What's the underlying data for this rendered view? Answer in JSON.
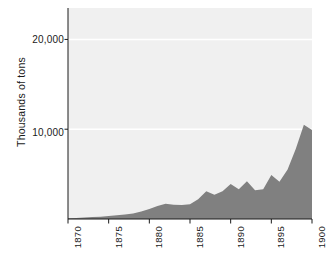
{
  "chart_data": {
    "type": "area",
    "title": "",
    "subtitle": "",
    "xlabel": "",
    "ylabel": "Thousands of tons",
    "xlim": [
      1870,
      1900
    ],
    "ylim": [
      0,
      23500
    ],
    "grid": true,
    "grid_color": "#ffffff",
    "legend": null,
    "legend_position": "none",
    "plot_background": "#f0f0f0",
    "series_color": "#808080",
    "x_tick_labels": [
      "1870",
      "1875",
      "1880",
      "1885",
      "1890",
      "1895",
      "1900"
    ],
    "x_tick_values": [
      1870,
      1875,
      1880,
      1885,
      1890,
      1895,
      1900
    ],
    "y_tick_labels": [
      "10,000",
      "20,000"
    ],
    "y_tick_values": [
      10000,
      20000
    ],
    "series": [
      {
        "name": "Output",
        "x": [
          1870,
          1871,
          1872,
          1873,
          1874,
          1875,
          1876,
          1877,
          1878,
          1879,
          1880,
          1881,
          1882,
          1883,
          1884,
          1885,
          1886,
          1887,
          1888,
          1889,
          1890,
          1891,
          1892,
          1893,
          1894,
          1895,
          1896,
          1897,
          1898,
          1899,
          1900
        ],
        "values": [
          70,
          110,
          170,
          230,
          260,
          330,
          420,
          500,
          620,
          830,
          1100,
          1450,
          1700,
          1600,
          1550,
          1650,
          2200,
          3100,
          2700,
          3100,
          3900,
          3300,
          4200,
          3200,
          3300,
          4900,
          4150,
          5500,
          7800,
          10500,
          9900
        ]
      }
    ]
  },
  "axes": {
    "y_title": "Thousands of tons",
    "y_ticks": [
      {
        "label": "20,000",
        "value": 20000
      },
      {
        "label": "10,000",
        "value": 10000
      }
    ],
    "x_ticks": [
      {
        "label": "1870",
        "value": 1870
      },
      {
        "label": "1875",
        "value": 1875
      },
      {
        "label": "1880",
        "value": 1880
      },
      {
        "label": "1885",
        "value": 1885
      },
      {
        "label": "1890",
        "value": 1890
      },
      {
        "label": "1895",
        "value": 1895
      },
      {
        "label": "1900",
        "value": 1900
      }
    ]
  },
  "ghost": {
    "a": "NOITAROPROC",
    "b": "DETIMIL YNAPMOC",
    "c": "erutcafunam",
    "d": "lairtsudni fo",
    "e": "noitcudorp"
  },
  "colors": {
    "plot_background": "#f0f0f0",
    "area_fill": "#808080",
    "gridline": "#ffffff",
    "axis": "#1a1a1a",
    "page_background": "#ffffff"
  }
}
